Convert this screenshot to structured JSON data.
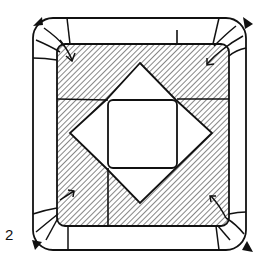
{
  "diagram": {
    "type": "origami-step",
    "step_number": "2",
    "colors": {
      "line": "#111111",
      "paper_face": "#ffffff",
      "hatch": "#222222"
    },
    "elements": [
      "outer-rounded-square",
      "hatched-inner-rounded-square",
      "four-point-star-flaps",
      "center-rounded-square",
      "corner-crimp-folds",
      "corner-push-arrows",
      "corner-fold-triangle-markers"
    ]
  }
}
